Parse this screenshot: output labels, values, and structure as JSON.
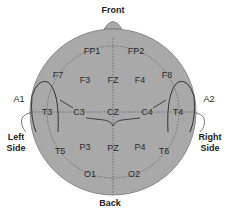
{
  "diagram": {
    "orientation": {
      "front": "Front",
      "back": "Back",
      "left": [
        "Left",
        "Side"
      ],
      "right": [
        "Right",
        "Side"
      ]
    },
    "ears": {
      "left": "A1",
      "right": "A2"
    },
    "electrodes": [
      {
        "id": "FP1",
        "x": 92,
        "y": 51
      },
      {
        "id": "FP2",
        "x": 136,
        "y": 51
      },
      {
        "id": "F7",
        "x": 58,
        "y": 75
      },
      {
        "id": "F3",
        "x": 85,
        "y": 80
      },
      {
        "id": "FZ",
        "x": 113,
        "y": 80
      },
      {
        "id": "F4",
        "x": 140,
        "y": 80
      },
      {
        "id": "F8",
        "x": 167,
        "y": 75
      },
      {
        "id": "T3",
        "x": 47,
        "y": 112
      },
      {
        "id": "C3",
        "x": 79,
        "y": 112
      },
      {
        "id": "CZ",
        "x": 113,
        "y": 112
      },
      {
        "id": "C4",
        "x": 147,
        "y": 112
      },
      {
        "id": "T4",
        "x": 178,
        "y": 112
      },
      {
        "id": "T5",
        "x": 60,
        "y": 151
      },
      {
        "id": "P3",
        "x": 85,
        "y": 147
      },
      {
        "id": "PZ",
        "x": 113,
        "y": 148
      },
      {
        "id": "P4",
        "x": 140,
        "y": 147
      },
      {
        "id": "T6",
        "x": 164,
        "y": 151
      },
      {
        "id": "O1",
        "x": 90,
        "y": 174
      },
      {
        "id": "O2",
        "x": 134,
        "y": 174
      }
    ],
    "colors": {
      "head_fill": "#a9a9a9",
      "outline": "#6e6e6e",
      "text": "#2a2a2a"
    }
  }
}
